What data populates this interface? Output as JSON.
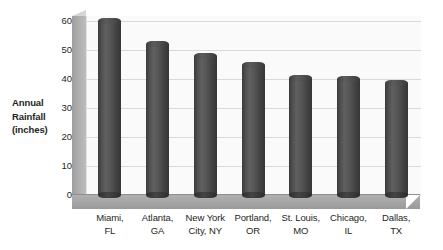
{
  "chart_data": {
    "type": "bar",
    "title": "",
    "subtitle": "",
    "xlabel": "",
    "ylabel": "Annual Rainfall (inches)",
    "ylabel_lines": [
      "Annual",
      "Rainfall",
      "(inches)"
    ],
    "categories": [
      "Miami, FL",
      "Atlanta, GA",
      "New York City, NY",
      "Portland, OR",
      "St. Louis, MO",
      "Chicago, IL",
      "Dallas, TX"
    ],
    "category_lines": [
      [
        "Miami,",
        "FL"
      ],
      [
        "Atlanta,",
        "GA"
      ],
      [
        "New York",
        "City, NY"
      ],
      [
        "Portland,",
        "OR"
      ],
      [
        "St. Louis,",
        "MO"
      ],
      [
        "Chicago,",
        "IL"
      ],
      [
        "Dallas,",
        "TX"
      ]
    ],
    "values": [
      60,
      52,
      48,
      45,
      40.5,
      40,
      38.5
    ],
    "ylim": [
      0,
      60
    ],
    "ytick_labels": [
      "0",
      "10",
      "20",
      "30",
      "40",
      "50",
      "60"
    ],
    "ytick_values": [
      0,
      10,
      20,
      30,
      40,
      50,
      60
    ],
    "grid": true,
    "legend": false,
    "legend_position": "none",
    "style": "3d-cylinder",
    "colors": {
      "bar": "#4e4e4e",
      "plot_background": "#fafafa",
      "gridline": "#d9d9d9",
      "floor": "#a3a3a3",
      "side_wall": "#adadad",
      "text": "#231f20"
    }
  }
}
